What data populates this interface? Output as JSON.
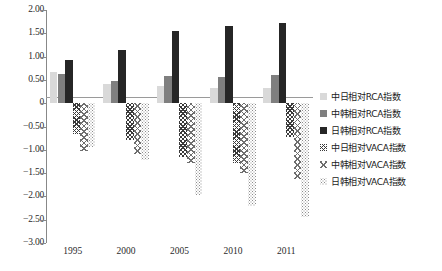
{
  "chart_data": {
    "type": "bar",
    "title": "",
    "subtitle": "",
    "xlabel": "",
    "ylabel": "",
    "categories": [
      "1995",
      "2000",
      "2005",
      "2010",
      "2011"
    ],
    "ylim": [
      -3.0,
      2.0
    ],
    "ytick_step": 0.5,
    "ytick_labels": [
      "2.00",
      "1.50",
      "1.00",
      "0.50",
      "0",
      "-0.50",
      "-1.00",
      "-1.50",
      "-2.00",
      "-2.50",
      "-3.00"
    ],
    "ytick_values": [
      2.0,
      1.5,
      1.0,
      0.5,
      0,
      -0.5,
      -1.0,
      -1.5,
      -2.0,
      -2.5,
      -3.0
    ],
    "grid": false,
    "legend_position": "right",
    "series": [
      {
        "name": "中日相对RCA指数",
        "key": "s0",
        "fill": "light-gray-solid",
        "color": "#d9d9d9",
        "values": [
          0.68,
          0.41,
          0.37,
          0.33,
          0.32
        ]
      },
      {
        "name": "中韩相对RCA指数",
        "key": "s1",
        "fill": "medium-gray-solid",
        "color": "#7f7f7f",
        "values": [
          0.62,
          0.47,
          0.59,
          0.56,
          0.6
        ]
      },
      {
        "name": "日韩相对RCA指数",
        "key": "s2",
        "fill": "black-solid",
        "color": "#262626",
        "values": [
          0.92,
          1.14,
          1.55,
          1.65,
          1.73
        ]
      },
      {
        "name": "中日相对VACA指数",
        "key": "s3",
        "fill": "dark-crosshatch",
        "color": "#3a3a3a",
        "values": [
          -0.67,
          -0.8,
          -1.15,
          -1.28,
          -0.73
        ]
      },
      {
        "name": "中韩相对VACA指数",
        "key": "s4",
        "fill": "light-crosshatch",
        "color": "#6e6e6e",
        "values": [
          -1.03,
          -1.1,
          -1.28,
          -1.5,
          -1.62
        ]
      },
      {
        "name": "日韩相对VACA指数",
        "key": "s5",
        "fill": "dotted-speckle",
        "color": "#8d8d8d",
        "values": [
          -0.95,
          -1.22,
          -1.98,
          -2.2,
          -2.45
        ]
      }
    ]
  },
  "legend": {
    "items": [
      {
        "label": "中日相对RCA指数"
      },
      {
        "label": "中韩相对RCA指数"
      },
      {
        "label": "日韩相对RCA指数"
      },
      {
        "label": "中日相对VACA指数"
      },
      {
        "label": "中韩相对VACA指数"
      },
      {
        "label": "日韩相对VACA指数"
      }
    ]
  }
}
